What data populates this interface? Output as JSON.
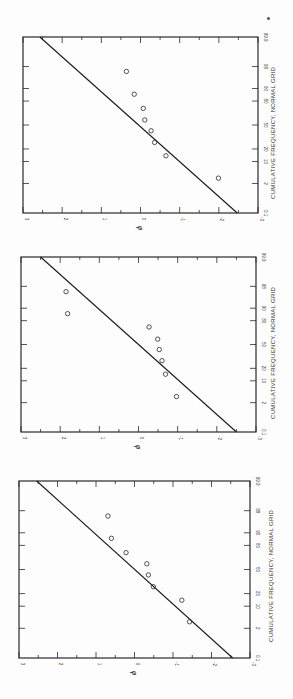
{
  "page": {
    "orientation": "rotated-90-clockwise",
    "page_mark": "•"
  },
  "chart_data": [
    {
      "type": "scatter",
      "title": "",
      "xlabel": "CUMULATIVE FREQUENCY, NORMAL GRID",
      "ylabel": "φ",
      "x_scale": "normal-probability",
      "x_ticks": [
        "0.1",
        "2",
        "10",
        "20",
        "50",
        "80",
        "90",
        "98",
        "99.9"
      ],
      "y_ticks": [
        "3",
        "2",
        "1",
        "0",
        "-1",
        "-2",
        "-3"
      ],
      "ylim": [
        -3,
        3
      ],
      "xlim": [
        0.1,
        99.9
      ],
      "grid": false,
      "series": [
        {
          "name": "observed",
          "marker": "open-circle",
          "x": [
            3.1,
            14,
            27,
            42,
            57,
            72,
            86,
            97
          ],
          "y": [
            -1.99,
            -0.65,
            -0.36,
            -0.27,
            -0.11,
            -0.07,
            0.16,
            0.36
          ]
        },
        {
          "name": "fitted-line",
          "marker": "line",
          "x": [
            0.1,
            99.9
          ],
          "y": [
            -2.47,
            2.57
          ]
        }
      ]
    },
    {
      "type": "scatter",
      "title": "",
      "xlabel": "CUMULATIVE FREQUENCY, NORMAL GRID",
      "ylabel": "φ",
      "x_scale": "normal-probability",
      "x_ticks": [
        "0.1",
        "2",
        "10",
        "20",
        "50",
        "80",
        "90",
        "98",
        "99.9"
      ],
      "y_ticks": [
        "3",
        "2",
        "1",
        "0",
        "-1",
        "-2",
        "-3"
      ],
      "ylim": [
        -3,
        3
      ],
      "xlim": [
        0.1,
        99.9
      ],
      "grid": false,
      "series": [
        {
          "name": "observed",
          "marker": "open-circle",
          "x": [
            3.3,
            14.7,
            28.4,
            43,
            57.5,
            73.2,
            86.2,
            96.9
          ],
          "y": [
            -0.97,
            -0.69,
            -0.6,
            -0.53,
            -0.49,
            -0.27,
            1.81,
            1.85
          ]
        },
        {
          "name": "fitted-line",
          "marker": "line",
          "x": [
            0.1,
            99.9
          ],
          "y": [
            -2.5,
            2.5
          ]
        }
      ]
    },
    {
      "type": "scatter",
      "title": "",
      "xlabel": "CUMULATIVE FREQUENCY, NORMAL GRID",
      "ylabel": "φ",
      "x_scale": "normal-probability",
      "x_ticks": [
        "0.1",
        "2",
        "10",
        "20",
        "50",
        "80",
        "90",
        "98",
        "99.9"
      ],
      "y_ticks": [
        "3",
        "2",
        "1",
        "0",
        "-1",
        "-2",
        "-3"
      ],
      "ylim": [
        -3,
        3
      ],
      "xlim": [
        0.1,
        99.9
      ],
      "grid": false,
      "series": [
        {
          "name": "observed",
          "marker": "open-circle",
          "x": [
            3.4,
            14.2,
            27.4,
            42.5,
            57.9,
            72.2,
            86.2,
            96.9
          ],
          "y": [
            -1.43,
            -1.23,
            -0.49,
            -0.36,
            -0.32,
            0.22,
            0.6,
            0.69
          ]
        },
        {
          "name": "fitted-line",
          "marker": "line",
          "x": [
            0.1,
            99.9
          ],
          "y": [
            -2.55,
            2.54
          ]
        }
      ]
    }
  ]
}
